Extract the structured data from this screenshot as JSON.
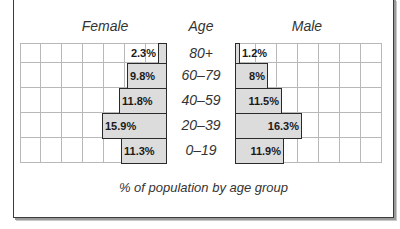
{
  "headers": {
    "female": "Female",
    "age": "Age",
    "male": "Male"
  },
  "caption": "% of population by age group",
  "rows": [
    {
      "age": "80+",
      "female_label": "2.3%",
      "male_label": "1.2%"
    },
    {
      "age": "60–79",
      "female_label": "9.8%",
      "male_label": "8%"
    },
    {
      "age": "40–59",
      "female_label": "11.8%",
      "male_label": "11.5%"
    },
    {
      "age": "20–39",
      "female_label": "15.9%",
      "male_label": "16.3%"
    },
    {
      "age": "0–19",
      "female_label": "11.3%",
      "male_label": "11.9%"
    }
  ],
  "colors": {
    "bar_fill": "#dcdcdc",
    "bar_border": "#2a2a2a",
    "grid": "#b8b8b8"
  },
  "chart_data": {
    "type": "bar",
    "subtype": "population-pyramid",
    "title": "",
    "xlabel": "% of population by age group",
    "ylabel": "Age",
    "categories": [
      "80+",
      "60–79",
      "40–59",
      "20–39",
      "0–19"
    ],
    "series": [
      {
        "name": "Female",
        "values": [
          2.3,
          9.8,
          11.8,
          15.9,
          11.3
        ]
      },
      {
        "name": "Male",
        "values": [
          1.2,
          8,
          11.5,
          16.3,
          11.9
        ]
      }
    ],
    "xlim": [
      0,
      35
    ],
    "grid": true,
    "grid_step": 5,
    "legend": "headers above each side (Female left, Male right)"
  }
}
